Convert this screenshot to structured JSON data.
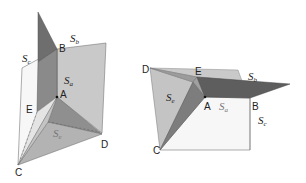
{
  "colors": {
    "plane_light": "#c9c9c9",
    "plane_mid": "#a9a9a9",
    "plane_dark": "#6e6e6e",
    "plane_darker": "#5a5a5a",
    "white_face": "#f7f7f7",
    "edge": "#555555",
    "label": "#222222",
    "label_light": "#777777"
  },
  "figures": [
    {
      "id": "left",
      "points": {
        "A": "A",
        "B": "B",
        "C": "C",
        "D": "D",
        "E": "E"
      },
      "planes": {
        "Sa": {
          "base": "S",
          "sub": "a"
        },
        "Sb": {
          "base": "S",
          "sub": "b"
        },
        "Sc": {
          "base": "S",
          "sub": "c"
        },
        "Se": {
          "base": "S",
          "sub": "e"
        }
      }
    },
    {
      "id": "right",
      "points": {
        "A": "A",
        "B": "B",
        "C": "C",
        "D": "D",
        "E": "E"
      },
      "planes": {
        "Sa": {
          "base": "S",
          "sub": "a"
        },
        "Sb": {
          "base": "S",
          "sub": "b"
        },
        "Sc": {
          "base": "S",
          "sub": "c"
        },
        "Se": {
          "base": "S",
          "sub": "e"
        }
      }
    }
  ]
}
